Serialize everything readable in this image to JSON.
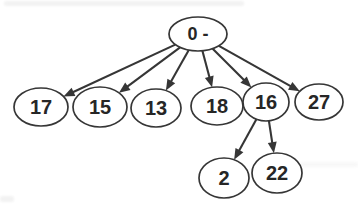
{
  "diagram": {
    "type": "tree",
    "background_color": "#ffffff",
    "stroke_color": "#363636",
    "text_color": "#262626",
    "node_fill": "#ffffff",
    "nodes": [
      {
        "id": "root",
        "label": "0 -",
        "cx": 198,
        "cy": 34,
        "rx": 29,
        "ry": 17,
        "font_size": 18
      },
      {
        "id": "17",
        "label": "17",
        "cx": 41,
        "cy": 107,
        "rx": 27,
        "ry": 19,
        "font_size": 20
      },
      {
        "id": "15",
        "label": "15",
        "cx": 100,
        "cy": 107,
        "rx": 27,
        "ry": 20,
        "font_size": 20
      },
      {
        "id": "13",
        "label": "13",
        "cx": 156,
        "cy": 108,
        "rx": 25,
        "ry": 19,
        "font_size": 20
      },
      {
        "id": "18",
        "label": "18",
        "cx": 217,
        "cy": 106,
        "rx": 26,
        "ry": 19,
        "font_size": 20
      },
      {
        "id": "16",
        "label": "16",
        "cx": 266,
        "cy": 102,
        "rx": 23,
        "ry": 19,
        "font_size": 20
      },
      {
        "id": "27",
        "label": "27",
        "cx": 319,
        "cy": 102,
        "rx": 24,
        "ry": 18,
        "font_size": 20
      },
      {
        "id": "2",
        "label": "2",
        "cx": 224,
        "cy": 178,
        "rx": 25,
        "ry": 20,
        "font_size": 20
      },
      {
        "id": "22",
        "label": "22",
        "cx": 277,
        "cy": 173,
        "rx": 25,
        "ry": 20,
        "font_size": 20
      }
    ],
    "edges": [
      {
        "from": "root",
        "to": "17"
      },
      {
        "from": "root",
        "to": "15"
      },
      {
        "from": "root",
        "to": "13"
      },
      {
        "from": "root",
        "to": "18"
      },
      {
        "from": "root",
        "to": "16"
      },
      {
        "from": "root",
        "to": "27"
      },
      {
        "from": "16",
        "to": "2"
      },
      {
        "from": "16",
        "to": "22"
      }
    ]
  }
}
